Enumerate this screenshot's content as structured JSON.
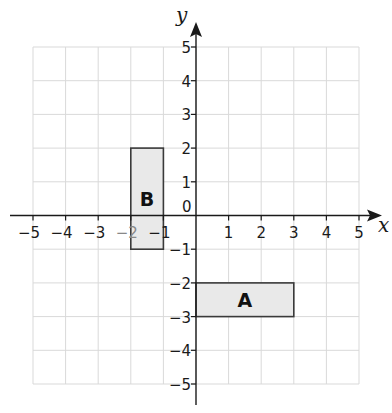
{
  "diagram": {
    "type": "coordinate-grid",
    "axes": {
      "x_label": "x",
      "y_label": "y",
      "x_range": [
        -5,
        5
      ],
      "y_range": [
        -5,
        5
      ],
      "origin_label": "0",
      "x_ticks": [
        "−5",
        "−4",
        "−3",
        "−2",
        "−1",
        "1",
        "2",
        "3",
        "4",
        "5"
      ],
      "y_ticks": [
        "5",
        "4",
        "3",
        "2",
        "1",
        "−1",
        "−2",
        "−3",
        "−4",
        "−5"
      ]
    },
    "shapes": [
      {
        "label": "A",
        "x1": 0,
        "y1": -3,
        "x2": 3,
        "y2": -2,
        "fill": "#e9e9e9",
        "stroke": "#3a3a3a"
      },
      {
        "label": "B",
        "x1": -2,
        "y1": -1,
        "x2": -1,
        "y2": 2,
        "fill": "#e9e9e9",
        "stroke": "#3a3a3a"
      }
    ],
    "colors": {
      "grid": "#d9d9d9",
      "axis": "#1a1a1a"
    }
  }
}
